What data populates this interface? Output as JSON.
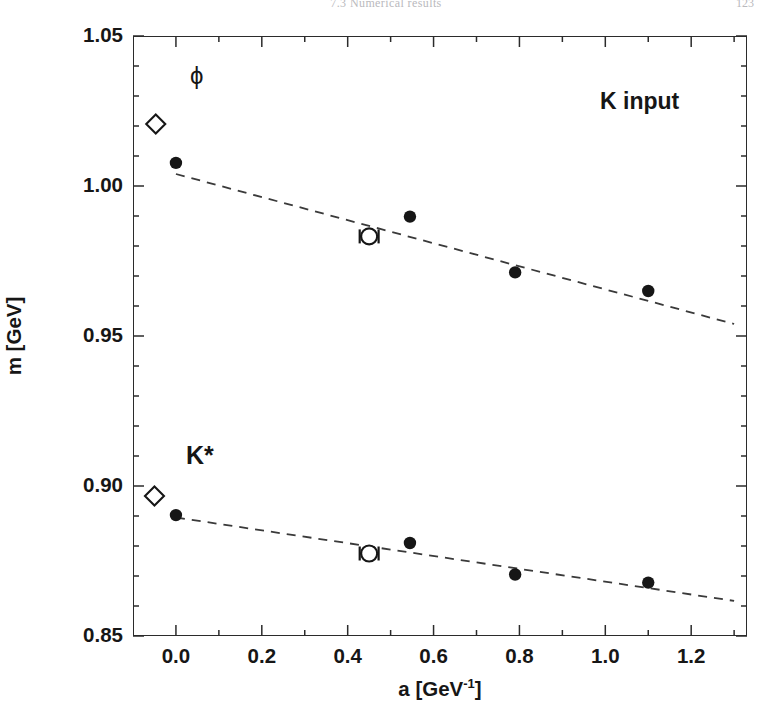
{
  "page": {
    "header_title": "7.3  Numerical results",
    "page_number": "123"
  },
  "figure": {
    "annotations": {
      "phi_label": "ϕ",
      "kstar_label": "K*",
      "input_label": "K input"
    }
  },
  "chart_data": {
    "type": "scatter",
    "title": "",
    "xlabel": "a [GeV⁻¹]",
    "ylabel": "m [GeV]",
    "xlim": [
      -0.1,
      1.33
    ],
    "ylim": [
      0.85,
      1.05
    ],
    "xticks": [
      0.0,
      0.2,
      0.4,
      0.6,
      0.8,
      1.0,
      1.2
    ],
    "xtick_labels": [
      "0.0",
      "0.2",
      "0.4",
      "0.6",
      "0.8",
      "1.0",
      "1.2"
    ],
    "yticks": [
      0.85,
      0.9,
      0.95,
      1.0,
      1.05
    ],
    "ytick_labels": [
      "0.85",
      "0.90",
      "0.95",
      "1.00",
      "1.05"
    ],
    "minor_xticks": [
      -0.1,
      0.1,
      0.3,
      0.5,
      0.7,
      0.9,
      1.1,
      1.3
    ],
    "minor_yticks": [
      0.86,
      0.87,
      0.88,
      0.89,
      0.91,
      0.92,
      0.93,
      0.94,
      0.96,
      0.97,
      0.98,
      0.99,
      1.01,
      1.02,
      1.03,
      1.04
    ],
    "grid": false,
    "legend": false,
    "marker_color": "#161616",
    "fit_line_color": "#3a3a3a",
    "series": [
      {
        "name": "phi",
        "label": "ϕ",
        "experiment_point": {
          "marker": "open-diamond",
          "x": -0.047,
          "y": 1.0207
        },
        "filled_points": [
          {
            "x": 0.0,
            "y": 1.0077,
            "yerr": 0.0072
          },
          {
            "x": 0.545,
            "y": 0.9898,
            "yerr": 0.0035
          },
          {
            "x": 0.79,
            "y": 0.9712,
            "yerr": 0.0025
          },
          {
            "x": 1.1,
            "y": 0.965,
            "yerr": 0.003
          }
        ],
        "open_points": [
          {
            "x": 0.45,
            "y": 0.9832,
            "yerr": 0.0085,
            "xerr": 0.022
          }
        ],
        "fit_line": {
          "x0": 0.0,
          "y0": 1.004,
          "x1": 1.3,
          "y1": 0.954
        }
      },
      {
        "name": "kstar",
        "label": "K*",
        "experiment_point": {
          "marker": "open-diamond",
          "x": -0.05,
          "y": 0.8967
        },
        "filled_points": [
          {
            "x": 0.0,
            "y": 0.8903,
            "yerr": 0.0045
          },
          {
            "x": 0.545,
            "y": 0.881,
            "yerr": 0.0022
          },
          {
            "x": 0.79,
            "y": 0.8705,
            "yerr": 0.0015
          },
          {
            "x": 1.1,
            "y": 0.8678,
            "yerr": 0.0018
          }
        ],
        "open_points": [
          {
            "x": 0.45,
            "y": 0.8775,
            "yerr": 0.0035,
            "xerr": 0.022
          }
        ],
        "fit_line": {
          "x0": 0.0,
          "y0": 0.8895,
          "x1": 1.3,
          "y1": 0.8617
        }
      }
    ]
  }
}
